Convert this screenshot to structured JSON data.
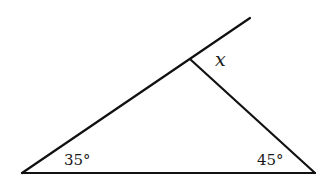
{
  "diagram": {
    "type": "triangle-exterior-angle",
    "stroke_color": "#111111",
    "vertices": {
      "left": [
        22,
        173
      ],
      "right": [
        315,
        173
      ],
      "top": [
        191,
        60
      ]
    },
    "extension_end": [
      250,
      18
    ],
    "labels": {
      "left_angle": "35°",
      "right_angle": "45°",
      "exterior_angle": "x"
    }
  }
}
